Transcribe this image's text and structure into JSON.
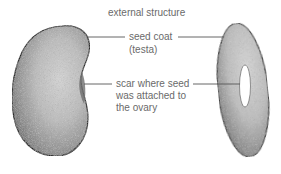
{
  "title": "external structure",
  "labels": {
    "seed_coat": {
      "line1": "seed coat",
      "line2": "(testa)"
    },
    "scar": {
      "line1": "scar where seed",
      "line2": "was attached to",
      "line3": "the ovary"
    }
  },
  "figures": [
    {
      "name": "bean-side-view",
      "description": "kidney-shaped bean seed, side view"
    },
    {
      "name": "bean-edge-view",
      "description": "bean seed edge view showing scar (hilum)"
    }
  ],
  "colors": {
    "outline": "#2a2a2a",
    "text": "#6a6a6a",
    "leader": "#555555"
  }
}
